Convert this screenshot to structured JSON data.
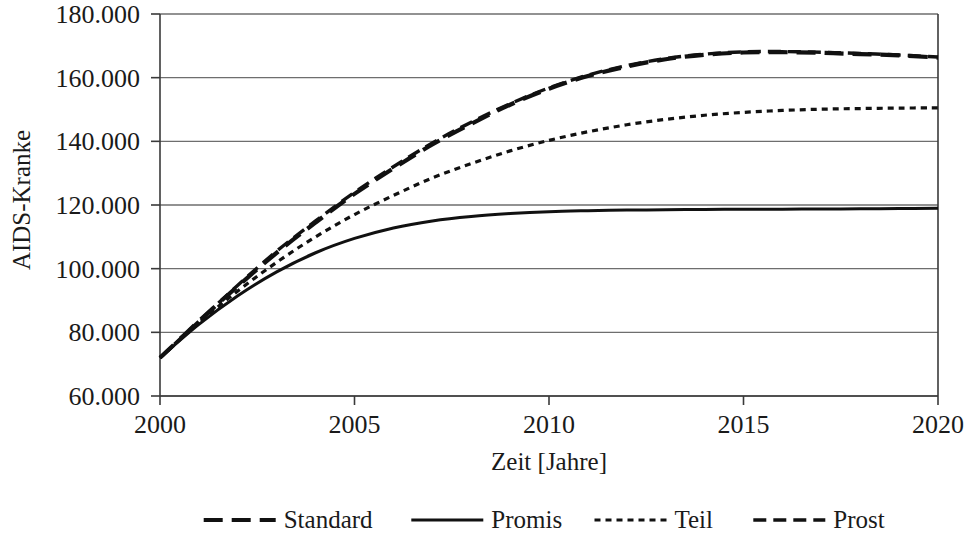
{
  "chart_data": {
    "type": "line",
    "title": "",
    "xlabel": "Zeit [Jahre]",
    "ylabel": "AIDS-Kranke",
    "xlim": [
      2000,
      2020
    ],
    "ylim": [
      60000,
      180000
    ],
    "xticks": [
      2000,
      2005,
      2010,
      2015,
      2020
    ],
    "xtick_labels": [
      "2000",
      "2005",
      "2010",
      "2015",
      "2020"
    ],
    "yticks": [
      60000,
      80000,
      100000,
      120000,
      140000,
      160000,
      180000
    ],
    "ytick_labels": [
      "60.000",
      "80.000",
      "100.000",
      "120.000",
      "140.000",
      "160.000",
      "180.000"
    ],
    "grid": "horizontal",
    "legend_position": "bottom",
    "x": [
      2000,
      2001,
      2002,
      2003,
      2004,
      2005,
      2006,
      2007,
      2008,
      2009,
      2010,
      2011,
      2012,
      2013,
      2014,
      2015,
      2016,
      2017,
      2018,
      2019,
      2020
    ],
    "series": [
      {
        "name": "Standard",
        "style": "long-dash",
        "color": "#111111",
        "values": [
          72000,
          83500,
          94500,
          105000,
          114500,
          123500,
          131500,
          139000,
          145500,
          151500,
          156500,
          160500,
          163500,
          165800,
          167200,
          167900,
          168000,
          167800,
          167400,
          167000,
          166300
        ]
      },
      {
        "name": "Promis",
        "style": "solid",
        "color": "#111111",
        "values": [
          72000,
          82500,
          91500,
          99000,
          105000,
          109500,
          112800,
          115000,
          116400,
          117300,
          117900,
          118200,
          118400,
          118500,
          118600,
          118650,
          118700,
          118750,
          118800,
          118900,
          119000
        ]
      },
      {
        "name": "Teil",
        "style": "dotted",
        "color": "#111111",
        "values": [
          72000,
          83000,
          93000,
          102000,
          110000,
          117000,
          123000,
          128500,
          133000,
          137000,
          140300,
          143000,
          145200,
          146900,
          148200,
          149100,
          149700,
          150100,
          150300,
          150450,
          150500
        ]
      },
      {
        "name": "Prost",
        "style": "dash",
        "color": "#111111",
        "values": [
          72000,
          83500,
          94800,
          105500,
          115000,
          124000,
          132000,
          139500,
          146000,
          151800,
          156800,
          160800,
          163800,
          166000,
          167400,
          168100,
          168200,
          168000,
          167600,
          167100,
          166500
        ]
      }
    ]
  },
  "legend": {
    "items": [
      {
        "label": "Standard",
        "style": "long-dash"
      },
      {
        "label": "Promis",
        "style": "solid"
      },
      {
        "label": "Teil",
        "style": "dotted"
      },
      {
        "label": "Prost",
        "style": "dash"
      }
    ]
  },
  "axes": {
    "y_title": "AIDS-Kranke",
    "x_title": "Zeit [Jahre]"
  }
}
